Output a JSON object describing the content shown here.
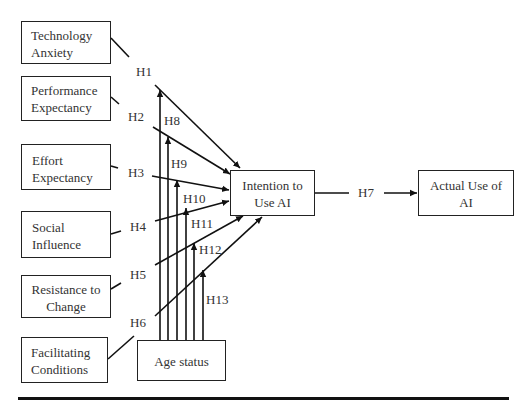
{
  "diagram": {
    "type": "research-model",
    "independent_variables": [
      {
        "id": "ta",
        "label_lines": [
          "Technology",
          "Anxiety"
        ]
      },
      {
        "id": "pe",
        "label_lines": [
          "Performance",
          "Expectancy"
        ]
      },
      {
        "id": "ee",
        "label_lines": [
          "Effort",
          "Expectancy"
        ]
      },
      {
        "id": "si",
        "label_lines": [
          "Social",
          "Influence"
        ]
      },
      {
        "id": "rc",
        "label_lines": [
          "Resistance to",
          "Change"
        ]
      },
      {
        "id": "fc",
        "label_lines": [
          "Facilitating",
          "Conditions"
        ]
      }
    ],
    "mediator": {
      "id": "iu",
      "label_lines": [
        "Intention to",
        "Use AI"
      ]
    },
    "outcome": {
      "id": "au",
      "label_lines": [
        "Actual Use of",
        "AI"
      ]
    },
    "moderator": {
      "id": "age",
      "label": "Age status"
    },
    "hypotheses": {
      "h1": "H1",
      "h2": "H2",
      "h3": "H3",
      "h4": "H4",
      "h5": "H5",
      "h6": "H6",
      "h7": "H7",
      "h8": "H8",
      "h9": "H9",
      "h10": "H10",
      "h11": "H11",
      "h12": "H12",
      "h13": "H13"
    },
    "edges": [
      {
        "from": "ta",
        "to": "iu",
        "label": "H1"
      },
      {
        "from": "pe",
        "to": "iu",
        "label": "H2"
      },
      {
        "from": "ee",
        "to": "iu",
        "label": "H3"
      },
      {
        "from": "si",
        "to": "iu",
        "label": "H4"
      },
      {
        "from": "rc",
        "to": "iu",
        "label": "H5"
      },
      {
        "from": "fc",
        "to": "iu",
        "label": "H6"
      },
      {
        "from": "iu",
        "to": "au",
        "label": "H7"
      },
      {
        "from": "age",
        "to": "H1 path",
        "label": "H8"
      },
      {
        "from": "age",
        "to": "H2 path",
        "label": "H9"
      },
      {
        "from": "age",
        "to": "H3 path",
        "label": "H10"
      },
      {
        "from": "age",
        "to": "H4 path",
        "label": "H11"
      },
      {
        "from": "age",
        "to": "H5 path",
        "label": "H12"
      },
      {
        "from": "age",
        "to": "H6 path",
        "label": "H13"
      }
    ]
  }
}
